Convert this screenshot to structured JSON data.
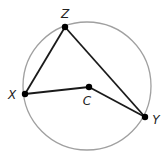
{
  "diagram": {
    "type": "circle-inscribed-triangle",
    "colors": {
      "circle": "#a0a0a0",
      "segment": "#1a1a1a",
      "point": "#000000",
      "label": "#222222"
    },
    "circle": {
      "center_label": "C",
      "cx": 87,
      "cy": 86,
      "r": 64
    },
    "points": [
      {
        "label": "Z",
        "x": 65,
        "y": 27,
        "label_x": 65,
        "label_y": 18
      },
      {
        "label": "X",
        "x": 25,
        "y": 94,
        "label_x": 12,
        "label_y": 99
      },
      {
        "label": "C",
        "x": 89,
        "y": 87,
        "label_x": 87,
        "label_y": 105
      },
      {
        "label": "Y",
        "x": 145,
        "y": 117,
        "label_x": 156,
        "label_y": 124
      }
    ],
    "segments": [
      {
        "from": "X",
        "to": "Z"
      },
      {
        "from": "Z",
        "to": "Y"
      },
      {
        "from": "X",
        "to": "C"
      },
      {
        "from": "C",
        "to": "Y"
      }
    ]
  }
}
